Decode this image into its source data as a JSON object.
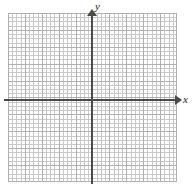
{
  "figure": {
    "type": "coordinate-plane",
    "title": "",
    "width": 195,
    "height": 185,
    "background_color": "#ffffff"
  },
  "axes": {
    "x": {
      "label": "x",
      "orientation": "horizontal",
      "color": "#4a4a4a",
      "arrow": "right",
      "pixel_y": 100,
      "start_px": 4,
      "end_px": 177
    },
    "y": {
      "label": "y",
      "orientation": "vertical",
      "color": "#4a4a4a",
      "arrow": "up",
      "pixel_x": 92,
      "start_px": 14,
      "end_px": 184
    },
    "origin_px": [
      92,
      100
    ]
  },
  "grid": {
    "style": "dotted",
    "minor_color": "#c9c9c9",
    "major_color": "#b0b0b0",
    "minor_spacing_px": 4.225,
    "major_spacing_px": 16.9,
    "left_px": 8,
    "top_px": 13,
    "width_px": 169,
    "height_px": 169,
    "major_columns": 10,
    "major_rows": 10
  },
  "chart_data": {
    "type": "scatter",
    "title": "",
    "xlabel": "x",
    "ylabel": "y",
    "categories": [],
    "values": [],
    "series": [],
    "xlim": [
      -5,
      5
    ],
    "ylim": [
      -5,
      5
    ],
    "xticks": [],
    "yticks": [],
    "grid": true,
    "legend": "none",
    "annotations": []
  }
}
